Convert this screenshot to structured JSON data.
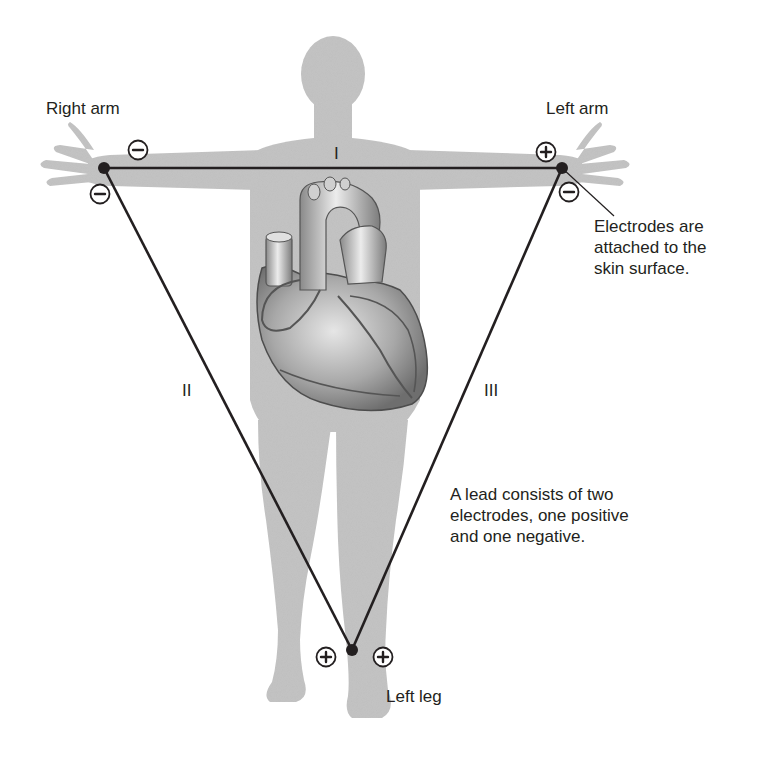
{
  "diagram": {
    "colors": {
      "body_silhouette": "#c4c4c4",
      "lines": "#231f20",
      "heart_light": "#d9d9d9",
      "heart_dark": "#7a7a7a",
      "text": "#231f20"
    },
    "limb_labels": {
      "right_arm": "Right arm",
      "left_arm": "Left arm",
      "left_leg": "Left leg"
    },
    "leads": [
      {
        "id": "I",
        "label": "I",
        "from": "right_arm",
        "to": "left_arm",
        "negative": "right_arm",
        "positive": "left_arm"
      },
      {
        "id": "II",
        "label": "II",
        "from": "right_arm",
        "to": "left_leg",
        "negative": "right_arm",
        "positive": "left_leg"
      },
      {
        "id": "III",
        "label": "III",
        "from": "left_arm",
        "to": "left_leg",
        "negative": "left_arm",
        "positive": "left_leg"
      }
    ],
    "electrodes": [
      {
        "id": "right_arm",
        "x": 104,
        "y": 168
      },
      {
        "id": "left_arm",
        "x": 562,
        "y": 168
      },
      {
        "id": "left_leg",
        "x": 352,
        "y": 650
      }
    ],
    "polarity_symbols": {
      "negative": "−",
      "positive": "+"
    },
    "annotations": {
      "electrodes_note_line1": "Electrodes are",
      "electrodes_note_line2": "attached to the",
      "electrodes_note_line3": "skin surface.",
      "lead_note_line1": "A lead consists of two",
      "lead_note_line2": "electrodes, one positive",
      "lead_note_line3": "and one negative."
    }
  }
}
